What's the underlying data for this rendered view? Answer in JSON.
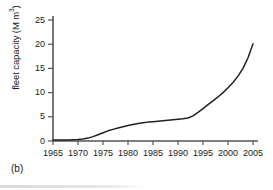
{
  "figure": {
    "panel_caption": "(b)",
    "line_color": "#222222",
    "axis_color": "#555555",
    "background": "#ffffff"
  },
  "chart_data": {
    "type": "line",
    "title": "",
    "xlabel": "",
    "ylabel": "fleet capacity (M m3)",
    "ylabel_text": "fleet capacity (M m",
    "ylabel_sup": "3",
    "ylabel_tail": ")",
    "xlim": [
      1965,
      2006
    ],
    "ylim": [
      0,
      26
    ],
    "grid": false,
    "legend": "none",
    "xticks": [
      1965,
      1970,
      1975,
      1980,
      1985,
      1990,
      1995,
      2000,
      2005
    ],
    "xtick_labels": [
      "1965",
      "1970",
      "1975",
      "1980",
      "1985",
      "1990",
      "1995",
      "2000",
      "2005"
    ],
    "yticks": [
      0,
      5,
      10,
      15,
      20,
      25
    ],
    "ytick_labels": [
      "0",
      "5",
      "10",
      "15",
      "20",
      "25"
    ],
    "series": [
      {
        "name": "fleet capacity",
        "x": [
          1965,
          1966,
          1967,
          1968,
          1969,
          1970,
          1971,
          1972,
          1973,
          1974,
          1975,
          1976,
          1977,
          1978,
          1979,
          1980,
          1981,
          1982,
          1983,
          1984,
          1985,
          1986,
          1987,
          1988,
          1989,
          1990,
          1991,
          1992,
          1993,
          1994,
          1995,
          1996,
          1997,
          1998,
          1999,
          2000,
          2001,
          2002,
          2003,
          2004,
          2005
        ],
        "values": [
          0.2,
          0.2,
          0.2,
          0.2,
          0.25,
          0.3,
          0.4,
          0.6,
          0.9,
          1.3,
          1.7,
          2.1,
          2.4,
          2.7,
          2.95,
          3.2,
          3.4,
          3.6,
          3.75,
          3.9,
          4.0,
          4.1,
          4.2,
          4.3,
          4.4,
          4.5,
          4.6,
          4.75,
          5.2,
          5.9,
          6.7,
          7.5,
          8.3,
          9.1,
          10.0,
          11.0,
          12.1,
          13.4,
          15.0,
          17.2,
          20.1
        ]
      }
    ]
  }
}
